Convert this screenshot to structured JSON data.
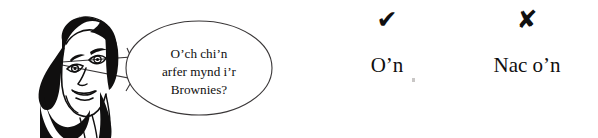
{
  "illustration": {
    "character_name": "smiling-woman-line-drawing",
    "speech_bubble": {
      "lines": [
        "O’ch chi’n",
        "arfer mynd i’r",
        "Brownies?"
      ],
      "full_text": "O’ch chi’n arfer mynd i’r Brownies?"
    }
  },
  "answers": [
    {
      "mark": "✔",
      "mark_icon": "check-mark-icon",
      "label": "O’n"
    },
    {
      "mark": "✘",
      "mark_icon": "cross-mark-icon",
      "label": "Nac o’n"
    }
  ],
  "colors": {
    "ink": "#100f0f",
    "background": "#ffffff",
    "bubble_stroke": "#3a3738",
    "speck": "#c9c7c6"
  }
}
